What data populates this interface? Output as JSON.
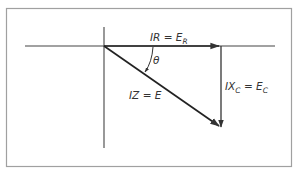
{
  "diagram": {
    "colors": {
      "stroke": "#333333",
      "frame": "#9a9a9a",
      "axis": "#444444",
      "background": "#ffffff"
    },
    "labels": {
      "resistive": {
        "main": "IR = E",
        "sub": "R"
      },
      "capacitive": {
        "main1": "IX",
        "sub1": "C",
        "main2": " = E",
        "sub2": "C"
      },
      "impedance": "IZ = E",
      "angle": "θ"
    },
    "vectors": [
      {
        "name": "IR = E_R",
        "direction": "horizontal-right"
      },
      {
        "name": "IX_C = E_C",
        "direction": "vertical-down"
      },
      {
        "name": "IZ = E",
        "direction": "diagonal-down-right"
      }
    ]
  }
}
